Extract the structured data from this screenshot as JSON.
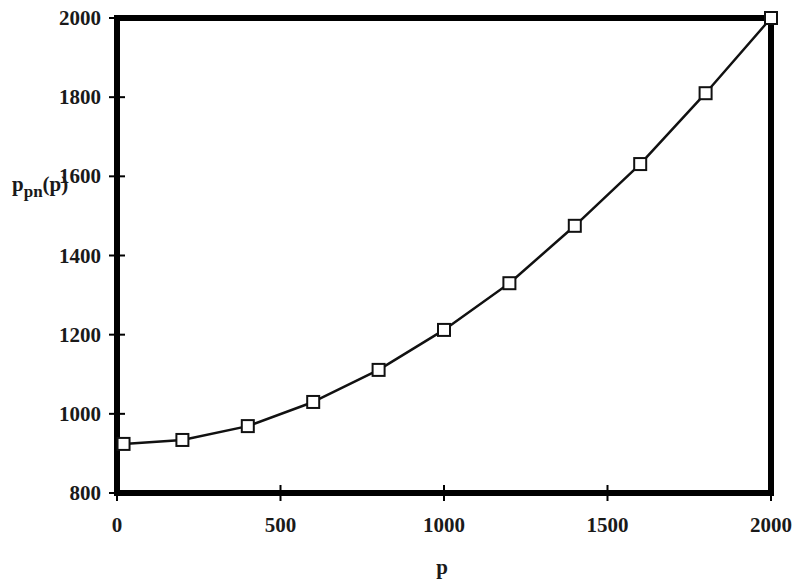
{
  "chart_data": {
    "type": "line",
    "title": "",
    "xlabel": "p",
    "ylabel": "p_pn(p)",
    "ylabel_parts": {
      "base": "p",
      "subscript": "pn",
      "suffix": "(p)"
    },
    "xlim": [
      0,
      2000
    ],
    "ylim": [
      800,
      2000
    ],
    "xticks": [
      0,
      500,
      1000,
      1500,
      2000
    ],
    "yticks": [
      800,
      1000,
      1200,
      1400,
      1600,
      1800,
      2000
    ],
    "grid": false,
    "legend": null,
    "marker": "open-square",
    "series": [
      {
        "name": "p_pn(p)",
        "x": [
          20,
          200,
          400,
          600,
          800,
          1000,
          1200,
          1400,
          1600,
          1800,
          2000
        ],
        "y": [
          924,
          934,
          969,
          1030,
          1111,
          1212,
          1330,
          1475,
          1631,
          1810,
          2000
        ]
      }
    ]
  },
  "colors": {
    "frame": "#000000",
    "line": "#111111",
    "marker_fill": "#ffffff",
    "background": "#ffffff"
  }
}
